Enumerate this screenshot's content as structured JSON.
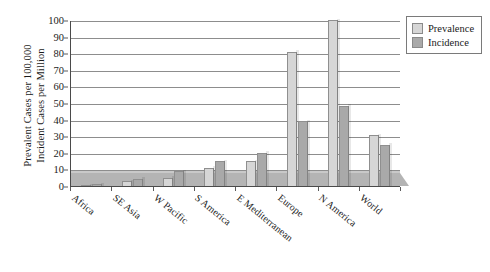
{
  "chart_data": {
    "type": "bar",
    "title": "",
    "xlabel": "",
    "ylabel": "Prevalent Cases per 100,000\nIncident Cases per Million",
    "ylabel_lines": [
      "Prevalent Cases per 100,000",
      "Incident Cases per Million"
    ],
    "categories": [
      "Africa",
      "SE Asia",
      "W Pacific",
      "S America",
      "E Mediterranean",
      "Europe",
      "N America",
      "World"
    ],
    "series": [
      {
        "name": "Prevalence",
        "color": "#d6d6d6",
        "values": [
          0.5,
          3,
          5,
          11,
          15,
          81,
          100,
          30.5
        ]
      },
      {
        "name": "Incidence",
        "color": "#a9a9a9",
        "values": [
          1,
          4.5,
          9,
          15,
          20,
          39,
          48.5,
          25
        ]
      }
    ],
    "ylim": [
      0,
      100
    ],
    "ytick_values": [
      0,
      10,
      20,
      30,
      40,
      50,
      60,
      70,
      80,
      90,
      100
    ],
    "ytick_labels": [
      "0",
      "10",
      "20",
      "30",
      "40",
      "50",
      "60",
      "70",
      "80",
      "90",
      "100"
    ],
    "grid": true,
    "legend_position": "top-right",
    "legend_entries": [
      "Prevalence",
      "Incidence"
    ]
  },
  "legend": {
    "items": [
      {
        "label": "Prevalence",
        "swatch": "prevalence"
      },
      {
        "label": "Incidence",
        "swatch": "incidence"
      }
    ]
  }
}
